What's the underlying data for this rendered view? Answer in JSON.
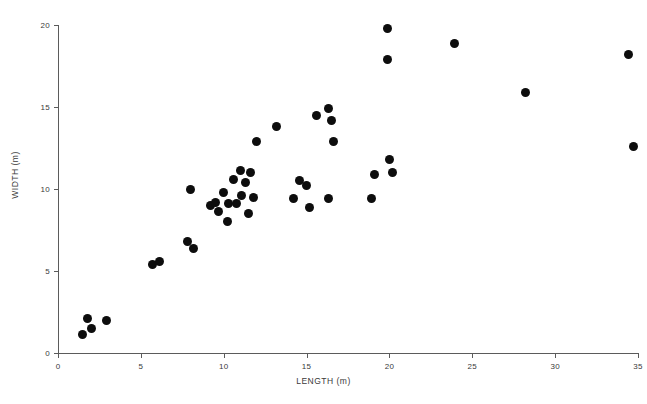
{
  "chart_data": {
    "type": "scatter",
    "title": "",
    "xlabel": "LENGTH (m)",
    "ylabel": "WIDTH (m)",
    "xlim": [
      0,
      35
    ],
    "ylim": [
      0,
      20
    ],
    "xticks": [
      0,
      5,
      10,
      15,
      20,
      25,
      30,
      35
    ],
    "yticks": [
      0,
      5,
      10,
      15,
      20
    ],
    "xtick_labels": [
      "0",
      "5",
      "10",
      "15",
      "20",
      "25",
      "30",
      "35"
    ],
    "ytick_labels": [
      "0",
      "5",
      "10",
      "15",
      "20"
    ],
    "grid": false,
    "legend": null,
    "marker": {
      "shape": "circle",
      "color": "#0d0d0d",
      "size_px": 9
    },
    "axis_color": "#5b5b5b",
    "background": "#ffffff",
    "points": [
      {
        "x": 1.5,
        "y": 1.1
      },
      {
        "x": 1.8,
        "y": 2.1
      },
      {
        "x": 2.0,
        "y": 1.5
      },
      {
        "x": 2.9,
        "y": 2.0
      },
      {
        "x": 5.7,
        "y": 5.4
      },
      {
        "x": 6.1,
        "y": 5.6
      },
      {
        "x": 7.8,
        "y": 6.8
      },
      {
        "x": 8.0,
        "y": 10.0
      },
      {
        "x": 8.2,
        "y": 6.4
      },
      {
        "x": 9.2,
        "y": 9.0
      },
      {
        "x": 9.5,
        "y": 9.2
      },
      {
        "x": 9.7,
        "y": 8.6
      },
      {
        "x": 10.0,
        "y": 9.8
      },
      {
        "x": 10.2,
        "y": 8.0
      },
      {
        "x": 10.3,
        "y": 9.1
      },
      {
        "x": 10.6,
        "y": 10.6
      },
      {
        "x": 10.8,
        "y": 9.1
      },
      {
        "x": 11.0,
        "y": 11.1
      },
      {
        "x": 11.1,
        "y": 9.6
      },
      {
        "x": 11.3,
        "y": 10.4
      },
      {
        "x": 11.5,
        "y": 8.5
      },
      {
        "x": 11.6,
        "y": 11.0
      },
      {
        "x": 11.8,
        "y": 9.5
      },
      {
        "x": 12.0,
        "y": 12.9
      },
      {
        "x": 13.2,
        "y": 13.8
      },
      {
        "x": 14.2,
        "y": 9.4
      },
      {
        "x": 14.6,
        "y": 10.5
      },
      {
        "x": 15.0,
        "y": 10.2
      },
      {
        "x": 15.2,
        "y": 8.9
      },
      {
        "x": 15.6,
        "y": 14.5
      },
      {
        "x": 16.3,
        "y": 14.9
      },
      {
        "x": 16.3,
        "y": 9.4
      },
      {
        "x": 16.5,
        "y": 14.2
      },
      {
        "x": 16.6,
        "y": 12.9
      },
      {
        "x": 18.9,
        "y": 9.4
      },
      {
        "x": 19.1,
        "y": 10.9
      },
      {
        "x": 19.9,
        "y": 19.8
      },
      {
        "x": 19.9,
        "y": 17.9
      },
      {
        "x": 20.0,
        "y": 11.8
      },
      {
        "x": 20.2,
        "y": 11.0
      },
      {
        "x": 23.9,
        "y": 18.9
      },
      {
        "x": 28.2,
        "y": 15.9
      },
      {
        "x": 34.4,
        "y": 18.2
      },
      {
        "x": 34.7,
        "y": 12.6
      }
    ]
  }
}
